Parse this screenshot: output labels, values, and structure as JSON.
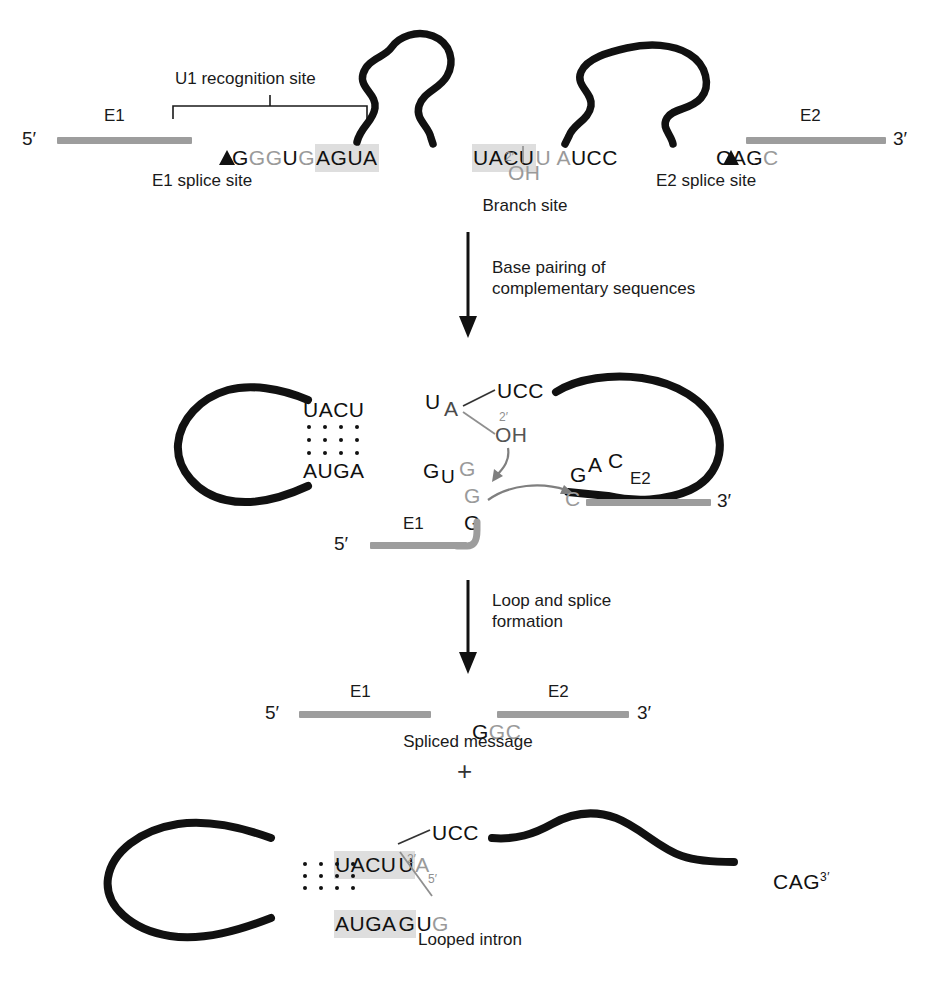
{
  "figure": {
    "colors": {
      "exon": "#9d9d9d",
      "intron": "#111111",
      "highlight": "#dedede",
      "gray_base": "#9a9a9a",
      "arrow": "#111111",
      "curved_arrow": "#8a8a8a"
    }
  },
  "panel1": {
    "name": "pre-mRNA",
    "end5": "5′",
    "end3": "3′",
    "exon1_label": "E1",
    "exon2_label": "E2",
    "u1_site_label": "U1 recognition site",
    "e1_splice_label": "E1 splice site",
    "e2_splice_label": "E2 splice site",
    "branch_label": "Branch site",
    "donor_seq": {
      "plain_before": "G",
      "gray1": "G",
      "gray2": "G",
      "mid": "U",
      "gray3": "G",
      "highlight": "AGUA",
      "full": "GGGUGAGUA"
    },
    "branch_seq": {
      "highlight": "UACU",
      "gray_u": "U",
      "gray_a": "A",
      "plain": "UCC",
      "full": "UACUUAUCC"
    },
    "branch_oh": {
      "prime": "2′",
      "label": "OH"
    },
    "acceptor_seq": {
      "plain": "CAG",
      "gray": "C",
      "full": "CAGC"
    }
  },
  "transition1": {
    "line1": "Base pairing of",
    "line2": "complementary sequences"
  },
  "panel2": {
    "name": "base-paired intermediate",
    "end5": "5′",
    "end3": "3′",
    "exon1_label": "E1",
    "exon2_label": "E2",
    "top_strand": {
      "highlight": "UACU",
      "u": "U",
      "a": "A",
      "tail": "UCC"
    },
    "bottom_strand": {
      "highlight": "AUGA",
      "g": "G",
      "u": "U",
      "g_gray": "G"
    },
    "oh": {
      "prime": "2′",
      "label": "OH"
    },
    "donor_tail": {
      "g_mid": "G",
      "g_bottom": "G"
    },
    "acceptor": {
      "g": "G",
      "a": "A",
      "c": "C",
      "c_gray": "C"
    },
    "basepair_count": 4
  },
  "transition2": {
    "line1": "Loop and splice",
    "line2": "formation"
  },
  "panel3": {
    "name": "spliced message",
    "end5": "5′",
    "end3": "3′",
    "exon1_label": "E1",
    "exon2_label": "E2",
    "junction": {
      "g_black": "G",
      "g_gray": "G",
      "c_gray": "C",
      "full": "GGC"
    },
    "caption": "Spliced message"
  },
  "plus_symbol": "+",
  "panel4": {
    "name": "looped intron",
    "caption": "Looped intron",
    "top_strand": {
      "highlight": "UACU",
      "u": "U",
      "a": "A",
      "tail": "UCC"
    },
    "bottom_strand": {
      "highlight": "AUGA",
      "g": "G",
      "u": "U",
      "g_gray": "G"
    },
    "linkage": {
      "prime2": "2′",
      "prime5": "5′"
    },
    "tail3": {
      "seq": "CAG",
      "end": "3′"
    },
    "basepair_count": 4
  }
}
